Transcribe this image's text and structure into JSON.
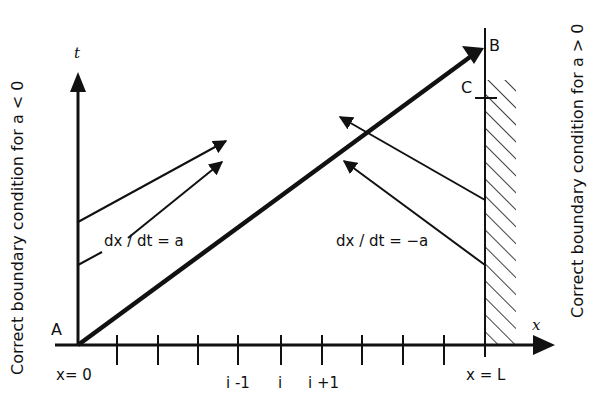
{
  "figure": {
    "axes": {
      "x_label": "x",
      "t_label": "t"
    },
    "points": {
      "A": "A",
      "B": "B",
      "C": "C"
    },
    "x_ticks": {
      "left_end": "x= 0",
      "i_minus_1": "i -1",
      "i": "i",
      "i_plus_1": "i +1",
      "right_end": "x = L"
    },
    "characteristic_labels": {
      "positive": "dx / dt = a",
      "negative": "dx / dt = −a"
    },
    "side_labels": {
      "left": "Correct boundary condition for a < 0",
      "right": "Correct boundary condition for a > 0"
    },
    "colors": {
      "ink": "#111111",
      "background": "#ffffff"
    }
  }
}
